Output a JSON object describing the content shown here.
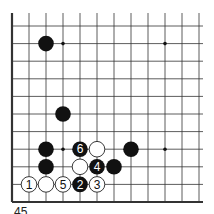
{
  "diagram": {
    "type": "go-board-corner",
    "grid": {
      "columns": 12,
      "rows": 11,
      "x0": 12,
      "dx": 17,
      "y0": 26,
      "dy": 17.6,
      "top_extension": 13,
      "right_extension": 203,
      "thick_edges": [
        "left",
        "bottom"
      ]
    },
    "star_points": [
      {
        "col": 3,
        "row": 1
      },
      {
        "col": 9,
        "row": 1
      },
      {
        "col": 3,
        "row": 7
      },
      {
        "col": 9,
        "row": 7
      }
    ],
    "stones": [
      {
        "color": "black",
        "col": 2,
        "row": 1,
        "label": ""
      },
      {
        "color": "black",
        "col": 3,
        "row": 5,
        "label": ""
      },
      {
        "color": "black",
        "col": 2,
        "row": 7,
        "label": ""
      },
      {
        "color": "black",
        "col": 4,
        "row": 7,
        "label": "6"
      },
      {
        "color": "white",
        "col": 5,
        "row": 7,
        "label": ""
      },
      {
        "color": "black",
        "col": 7,
        "row": 7,
        "label": ""
      },
      {
        "color": "black",
        "col": 2,
        "row": 8,
        "label": ""
      },
      {
        "color": "white",
        "col": 4,
        "row": 8,
        "label": ""
      },
      {
        "color": "black",
        "col": 5,
        "row": 8,
        "label": "4"
      },
      {
        "color": "black",
        "col": 6,
        "row": 8,
        "label": ""
      },
      {
        "color": "white",
        "col": 1,
        "row": 9,
        "label": "1"
      },
      {
        "color": "white",
        "col": 2,
        "row": 9,
        "label": ""
      },
      {
        "color": "white",
        "col": 3,
        "row": 9,
        "label": "5"
      },
      {
        "color": "black",
        "col": 4,
        "row": 9,
        "label": "2"
      },
      {
        "color": "white",
        "col": 5,
        "row": 9,
        "label": "3"
      }
    ],
    "caption": "45",
    "colors": {
      "line": "#333333",
      "black_stone": "#111111",
      "white_stone": "#ffffff",
      "stone_outline": "#222222"
    }
  }
}
